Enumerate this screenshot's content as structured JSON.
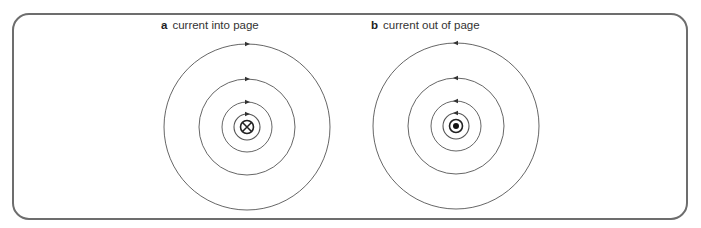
{
  "panels": [
    {
      "letter": "a",
      "caption": "current into page",
      "current_direction": "into-page",
      "symbol": "cross-in-circle",
      "field_direction": "clockwise",
      "center": [
        247,
        127
      ],
      "radii": [
        83,
        48,
        25,
        13
      ]
    },
    {
      "letter": "b",
      "caption": "current out of page",
      "current_direction": "out-of-page",
      "symbol": "dot-in-circle",
      "field_direction": "counterclockwise",
      "center": [
        456,
        126
      ],
      "radii": [
        83,
        48,
        25,
        13
      ]
    }
  ],
  "colors": {
    "frame": "#6d6d6d",
    "field_line": "#555555",
    "text": "#333333"
  }
}
